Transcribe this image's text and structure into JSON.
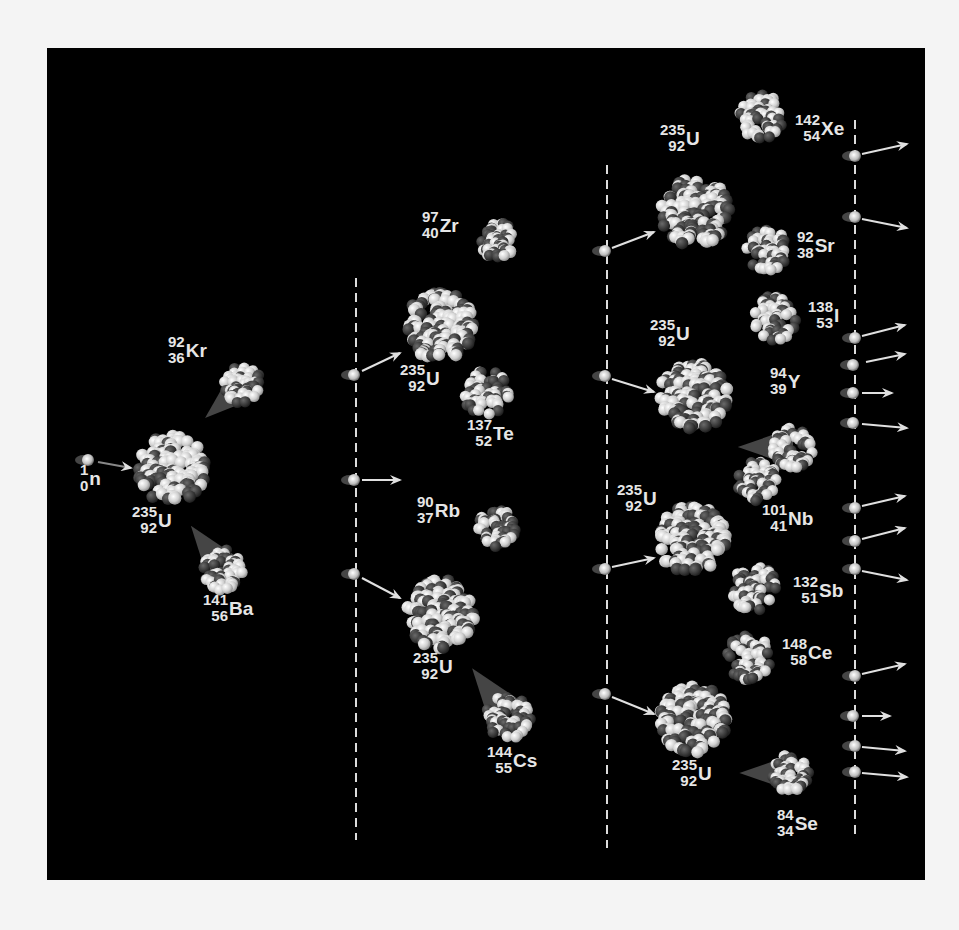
{
  "diagram": {
    "colors": {
      "background": "#000000",
      "page": "#f4f4f4",
      "proton": "#d8d8d8",
      "neutron": "#3a3a3a",
      "label": "#e6e6e6",
      "arrow": "#e0e0e0",
      "dashed_line": "#dcdcdc"
    },
    "dashed_lines": [
      {
        "x": 356,
        "y1": 278,
        "y2": 840
      },
      {
        "x": 607,
        "y1": 165,
        "y2": 848
      },
      {
        "x": 855,
        "y1": 120,
        "y2": 840
      }
    ],
    "nuclei": [
      {
        "id": "u235-gen1",
        "cx": 172,
        "cy": 469,
        "r": 38,
        "type": "uranium",
        "label": {
          "mass": "235",
          "atomic": "92",
          "symbol": "U",
          "x": 132,
          "y": 520
        }
      },
      {
        "id": "kr92",
        "cx": 243,
        "cy": 385,
        "r": 22,
        "type": "fragment",
        "trail": "down-left",
        "label": {
          "mass": "92",
          "atomic": "36",
          "symbol": "Kr",
          "x": 168,
          "y": 350
        }
      },
      {
        "id": "ba141",
        "cx": 224,
        "cy": 570,
        "r": 24,
        "type": "fragment",
        "trail": "up-left",
        "label": {
          "mass": "141",
          "atomic": "56",
          "symbol": "Ba",
          "x": 203,
          "y": 608
        }
      },
      {
        "id": "u235-gen2a",
        "cx": 440,
        "cy": 326,
        "r": 38,
        "type": "uranium",
        "label": {
          "mass": "235",
          "atomic": "92",
          "symbol": "U",
          "x": 400,
          "y": 378
        }
      },
      {
        "id": "zr97",
        "cx": 497,
        "cy": 240,
        "r": 22,
        "type": "fragment",
        "label": {
          "mass": "97",
          "atomic": "40",
          "symbol": "Zr",
          "x": 422,
          "y": 225
        }
      },
      {
        "id": "te137",
        "cx": 486,
        "cy": 393,
        "r": 26,
        "type": "fragment",
        "label": {
          "mass": "137",
          "atomic": "52",
          "symbol": "Te",
          "x": 467,
          "y": 433
        }
      },
      {
        "id": "rb90",
        "cx": 497,
        "cy": 528,
        "r": 22,
        "type": "fragment",
        "label": {
          "mass": "90",
          "atomic": "37",
          "symbol": "Rb",
          "x": 417,
          "y": 510
        }
      },
      {
        "id": "u235-gen2b",
        "cx": 440,
        "cy": 614,
        "r": 38,
        "type": "uranium",
        "label": {
          "mass": "235",
          "atomic": "92",
          "symbol": "U",
          "x": 413,
          "y": 666
        }
      },
      {
        "id": "cs144",
        "cx": 508,
        "cy": 716,
        "r": 26,
        "type": "fragment",
        "trail": "up-left",
        "label": {
          "mass": "144",
          "atomic": "55",
          "symbol": "Cs",
          "x": 487,
          "y": 760
        }
      },
      {
        "id": "u235-gen3a",
        "cx": 695,
        "cy": 212,
        "r": 38,
        "type": "uranium",
        "label": {
          "mass": "235",
          "atomic": "92",
          "symbol": "U",
          "x": 660,
          "y": 138
        }
      },
      {
        "id": "xe142",
        "cx": 762,
        "cy": 117,
        "r": 26,
        "type": "fragment",
        "label": {
          "mass": "142",
          "atomic": "54",
          "symbol": "Xe",
          "x": 795,
          "y": 128
        }
      },
      {
        "id": "sr92",
        "cx": 767,
        "cy": 250,
        "r": 24,
        "type": "fragment",
        "label": {
          "mass": "92",
          "atomic": "38",
          "symbol": "Sr",
          "x": 797,
          "y": 245
        }
      },
      {
        "id": "i138",
        "cx": 774,
        "cy": 318,
        "r": 26,
        "type": "fragment",
        "label": {
          "mass": "138",
          "atomic": "53",
          "symbol": "I",
          "x": 808,
          "y": 315
        }
      },
      {
        "id": "u235-gen3b",
        "cx": 694,
        "cy": 396,
        "r": 38,
        "type": "uranium",
        "label": {
          "mass": "235",
          "atomic": "92",
          "symbol": "U",
          "x": 650,
          "y": 333
        }
      },
      {
        "id": "y94",
        "cx": 793,
        "cy": 447,
        "r": 24,
        "type": "fragment",
        "trail": "left",
        "label": {
          "mass": "94",
          "atomic": "39",
          "symbol": "Y",
          "x": 770,
          "y": 381
        }
      },
      {
        "id": "nb101",
        "cx": 758,
        "cy": 482,
        "r": 24,
        "type": "fragment",
        "label": {
          "mass": "101",
          "atomic": "41",
          "symbol": "Nb",
          "x": 762,
          "y": 518
        }
      },
      {
        "id": "u235-gen3c",
        "cx": 692,
        "cy": 540,
        "r": 38,
        "type": "uranium",
        "label": {
          "mass": "235",
          "atomic": "92",
          "symbol": "U",
          "x": 617,
          "y": 498
        }
      },
      {
        "id": "sb132",
        "cx": 754,
        "cy": 588,
        "r": 26,
        "type": "fragment",
        "label": {
          "mass": "132",
          "atomic": "51",
          "symbol": "Sb",
          "x": 793,
          "y": 590
        }
      },
      {
        "id": "ce148",
        "cx": 748,
        "cy": 657,
        "r": 26,
        "type": "fragment",
        "label": {
          "mass": "148",
          "atomic": "58",
          "symbol": "Ce",
          "x": 782,
          "y": 652
        }
      },
      {
        "id": "u235-gen3d",
        "cx": 693,
        "cy": 719,
        "r": 38,
        "type": "uranium",
        "label": {
          "mass": "235",
          "atomic": "92",
          "symbol": "U",
          "x": 672,
          "y": 773
        }
      },
      {
        "id": "se84",
        "cx": 790,
        "cy": 773,
        "r": 22,
        "type": "fragment",
        "trail": "left",
        "label": {
          "mass": "84",
          "atomic": "34",
          "symbol": "Se",
          "x": 777,
          "y": 823
        }
      }
    ],
    "neutrons": [
      {
        "x": 88,
        "y": 460,
        "ax1": 98,
        "ay1": 462,
        "ax2": 131,
        "ay2": 468
      },
      {
        "x": 354,
        "y": 375,
        "ax1": 362,
        "ay1": 371,
        "ax2": 400,
        "ay2": 353
      },
      {
        "x": 354,
        "y": 480,
        "ax1": 362,
        "ay1": 480,
        "ax2": 400,
        "ay2": 480
      },
      {
        "x": 354,
        "y": 574,
        "ax1": 362,
        "ay1": 578,
        "ax2": 400,
        "ay2": 598
      },
      {
        "x": 605,
        "y": 251,
        "ax1": 612,
        "ay1": 248,
        "ax2": 654,
        "ay2": 232
      },
      {
        "x": 605,
        "y": 376,
        "ax1": 612,
        "ay1": 379,
        "ax2": 654,
        "ay2": 392
      },
      {
        "x": 605,
        "y": 569,
        "ax1": 612,
        "ay1": 567,
        "ax2": 654,
        "ay2": 558
      },
      {
        "x": 605,
        "y": 694,
        "ax1": 612,
        "ay1": 697,
        "ax2": 654,
        "ay2": 714
      },
      {
        "x": 855,
        "y": 156,
        "ax1": 862,
        "ay1": 154,
        "ax2": 907,
        "ay2": 144
      },
      {
        "x": 855,
        "y": 217,
        "ax1": 862,
        "ay1": 219,
        "ax2": 907,
        "ay2": 228
      },
      {
        "x": 855,
        "y": 338,
        "ax1": 862,
        "ay1": 336,
        "ax2": 905,
        "ay2": 325
      },
      {
        "x": 853,
        "y": 365,
        "ax1": 866,
        "ay1": 362,
        "ax2": 905,
        "ay2": 354
      },
      {
        "x": 853,
        "y": 393,
        "ax1": 862,
        "ay1": 393,
        "ax2": 892,
        "ay2": 393
      },
      {
        "x": 853,
        "y": 423,
        "ax1": 862,
        "ay1": 424,
        "ax2": 907,
        "ay2": 428
      },
      {
        "x": 855,
        "y": 508,
        "ax1": 862,
        "ay1": 506,
        "ax2": 905,
        "ay2": 496
      },
      {
        "x": 855,
        "y": 541,
        "ax1": 862,
        "ay1": 539,
        "ax2": 905,
        "ay2": 528
      },
      {
        "x": 855,
        "y": 569,
        "ax1": 862,
        "ay1": 571,
        "ax2": 907,
        "ay2": 580
      },
      {
        "x": 855,
        "y": 676,
        "ax1": 862,
        "ay1": 674,
        "ax2": 905,
        "ay2": 664
      },
      {
        "x": 853,
        "y": 716,
        "ax1": 862,
        "ay1": 716,
        "ax2": 890,
        "ay2": 716
      },
      {
        "x": 855,
        "y": 746,
        "ax1": 862,
        "ay1": 747,
        "ax2": 905,
        "ay2": 751
      },
      {
        "x": 855,
        "y": 772,
        "ax1": 862,
        "ay1": 773,
        "ax2": 907,
        "ay2": 777
      }
    ],
    "incident_neutron_label": {
      "mass": "1",
      "atomic": "0",
      "symbol": "n",
      "x": 80,
      "y": 478
    }
  }
}
